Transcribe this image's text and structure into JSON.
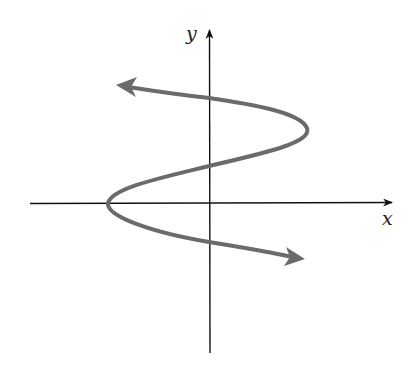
{
  "diagram": {
    "axes": {
      "x_label": "x",
      "y_label": "y"
    },
    "colors": {
      "axis": "#111111",
      "curve": "#6b6b6b",
      "background": "#ffffff"
    },
    "curve": {
      "shape": "sideways cubic (x as function of y)",
      "ends": [
        "arrow pointing upper-left",
        "arrow pointing lower-right"
      ],
      "y_axis_crossings": 3,
      "x_axis_crossings": 1
    }
  }
}
